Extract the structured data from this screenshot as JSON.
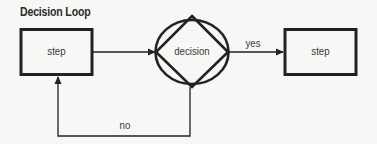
{
  "diagram": {
    "title": "Decision Loop",
    "nodes": [
      {
        "id": "step1",
        "shape": "rectangle",
        "label": "step"
      },
      {
        "id": "decision",
        "shape": "diamond-in-ellipse",
        "label": "decision"
      },
      {
        "id": "step2",
        "shape": "rectangle",
        "label": "step"
      }
    ],
    "edges": [
      {
        "from": "step1",
        "to": "decision",
        "label": ""
      },
      {
        "from": "decision",
        "to": "step2",
        "label": "yes"
      },
      {
        "from": "decision",
        "to": "step1",
        "label": "no"
      }
    ],
    "colors": {
      "stroke": "#222222",
      "text": "#3a3a3a",
      "background": "#f7f7f5"
    }
  }
}
